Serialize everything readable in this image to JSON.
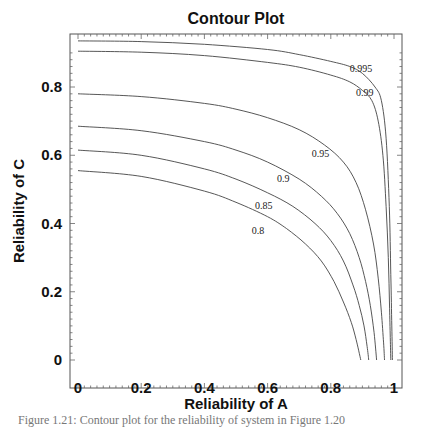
{
  "chart_data": {
    "type": "line",
    "subtype": "contour",
    "title": "Contour Plot",
    "xlabel": "Reliability of A",
    "ylabel": "Reliability of C",
    "xlim": [
      -0.02,
      1.02
    ],
    "ylim": [
      -0.04,
      0.956
    ],
    "x_ticks": [
      0,
      0.2,
      0.4,
      0.6,
      0.8,
      1
    ],
    "x_tick_labels": [
      "0",
      "0.2",
      "0.4",
      "0.6",
      "0.8",
      "1"
    ],
    "y_ticks": [
      0,
      0.2,
      0.4,
      0.6,
      0.8
    ],
    "y_tick_labels": [
      "0",
      "0.2",
      "0.4",
      "0.6",
      "0.8"
    ],
    "grid": false,
    "legend": null,
    "series": [
      {
        "name": "0.995",
        "label": "0.995",
        "label_pos": [
          0.86,
          0.845
        ],
        "points": [
          [
            0,
            0.935
          ],
          [
            0.2,
            0.933
          ],
          [
            0.4,
            0.925
          ],
          [
            0.6,
            0.91
          ],
          [
            0.7,
            0.895
          ],
          [
            0.8,
            0.875
          ],
          [
            0.86,
            0.86
          ],
          [
            0.9,
            0.84
          ],
          [
            0.94,
            0.8
          ],
          [
            0.96,
            0.76
          ],
          [
            0.975,
            0.65
          ],
          [
            0.985,
            0.45
          ],
          [
            0.99,
            0.25
          ],
          [
            0.993,
            0.1
          ],
          [
            0.995,
            0
          ]
        ]
      },
      {
        "name": "0.99",
        "label": "0.99",
        "label_pos": [
          0.88,
          0.775
        ],
        "points": [
          [
            0,
            0.905
          ],
          [
            0.2,
            0.902
          ],
          [
            0.4,
            0.892
          ],
          [
            0.6,
            0.872
          ],
          [
            0.7,
            0.858
          ],
          [
            0.8,
            0.835
          ],
          [
            0.86,
            0.815
          ],
          [
            0.9,
            0.79
          ],
          [
            0.93,
            0.76
          ],
          [
            0.95,
            0.7
          ],
          [
            0.965,
            0.6
          ],
          [
            0.975,
            0.45
          ],
          [
            0.982,
            0.3
          ],
          [
            0.986,
            0.15
          ],
          [
            0.99,
            0
          ]
        ]
      },
      {
        "name": "0.95",
        "label": "0.95",
        "label_pos": [
          0.74,
          0.595
        ],
        "points": [
          [
            0,
            0.78
          ],
          [
            0.2,
            0.772
          ],
          [
            0.4,
            0.752
          ],
          [
            0.5,
            0.735
          ],
          [
            0.6,
            0.71
          ],
          [
            0.7,
            0.675
          ],
          [
            0.78,
            0.63
          ],
          [
            0.84,
            0.58
          ],
          [
            0.88,
            0.52
          ],
          [
            0.91,
            0.44
          ],
          [
            0.935,
            0.34
          ],
          [
            0.95,
            0.24
          ],
          [
            0.96,
            0.14
          ],
          [
            0.967,
            0.05
          ],
          [
            0.97,
            0
          ]
        ]
      },
      {
        "name": "0.9",
        "label": "0.9",
        "label_pos": [
          0.63,
          0.522
        ],
        "points": [
          [
            0,
            0.685
          ],
          [
            0.2,
            0.672
          ],
          [
            0.4,
            0.64
          ],
          [
            0.5,
            0.615
          ],
          [
            0.6,
            0.58
          ],
          [
            0.7,
            0.53
          ],
          [
            0.77,
            0.48
          ],
          [
            0.82,
            0.43
          ],
          [
            0.86,
            0.37
          ],
          [
            0.89,
            0.3
          ],
          [
            0.91,
            0.23
          ],
          [
            0.925,
            0.16
          ],
          [
            0.937,
            0.08
          ],
          [
            0.945,
            0
          ]
        ]
      },
      {
        "name": "0.85",
        "label": "0.85",
        "label_pos": [
          0.56,
          0.442
        ],
        "points": [
          [
            0,
            0.615
          ],
          [
            0.2,
            0.6
          ],
          [
            0.4,
            0.56
          ],
          [
            0.5,
            0.53
          ],
          [
            0.6,
            0.49
          ],
          [
            0.68,
            0.45
          ],
          [
            0.75,
            0.4
          ],
          [
            0.8,
            0.35
          ],
          [
            0.84,
            0.29
          ],
          [
            0.87,
            0.22
          ],
          [
            0.89,
            0.16
          ],
          [
            0.905,
            0.1
          ],
          [
            0.915,
            0.04
          ],
          [
            0.92,
            0
          ]
        ]
      },
      {
        "name": "0.8",
        "label": "0.8",
        "label_pos": [
          0.55,
          0.37
        ],
        "points": [
          [
            0,
            0.555
          ],
          [
            0.2,
            0.538
          ],
          [
            0.4,
            0.495
          ],
          [
            0.5,
            0.462
          ],
          [
            0.6,
            0.42
          ],
          [
            0.66,
            0.385
          ],
          [
            0.72,
            0.34
          ],
          [
            0.77,
            0.29
          ],
          [
            0.81,
            0.23
          ],
          [
            0.84,
            0.17
          ],
          [
            0.865,
            0.11
          ],
          [
            0.88,
            0.06
          ],
          [
            0.895,
            0
          ]
        ]
      }
    ]
  },
  "caption": "Figure 1.21:  Contour plot for the reliability of system in Figure 1.20"
}
